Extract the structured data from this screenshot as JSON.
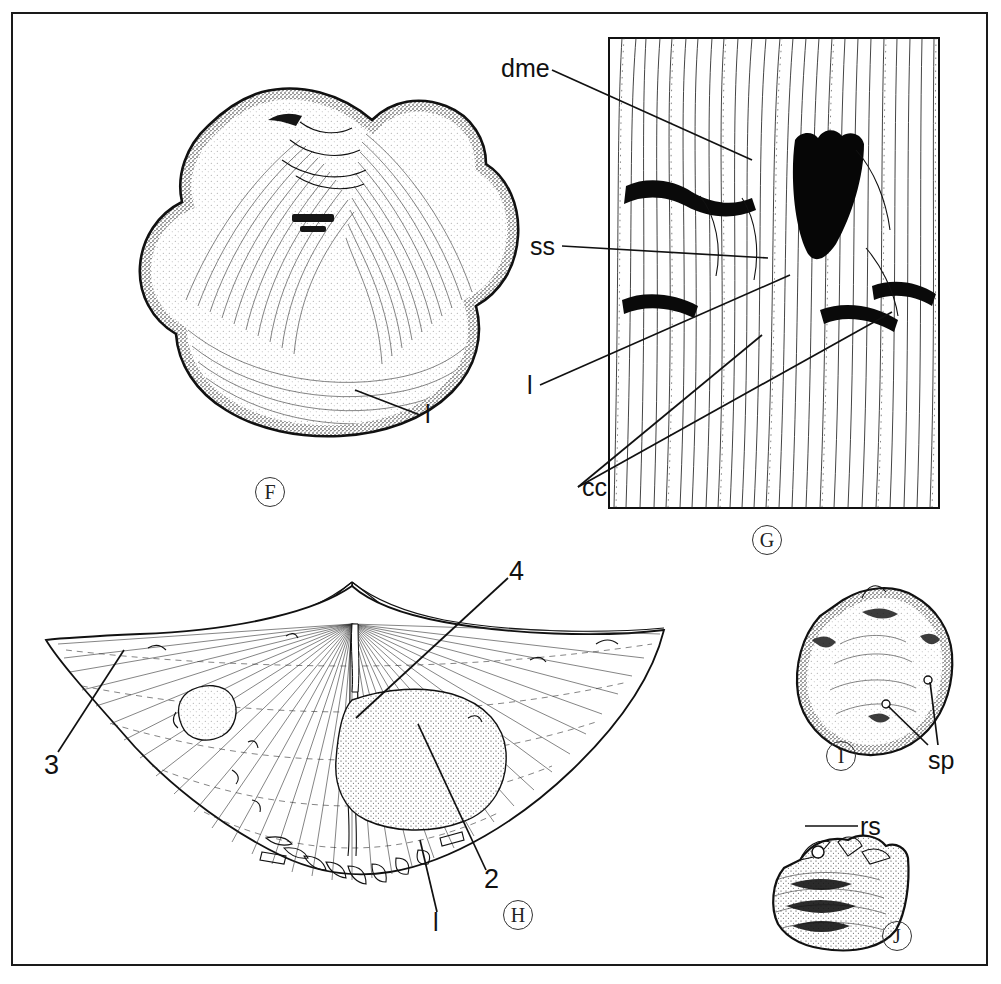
{
  "figure": {
    "type": "scientific-plate",
    "background_color": "#ffffff",
    "ink_color": "#111111",
    "border_color": "#1a1a1a"
  },
  "panels": [
    {
      "id": "F",
      "tag": "F",
      "kind": "specimen-stipple-drawing",
      "description": "Sub-circular brachiopod valve in plan view with radial costellae and concentric growth lamellae",
      "annotations": [
        {
          "text": "l",
          "name": "lamella-label"
        }
      ]
    },
    {
      "id": "G",
      "tag": "G",
      "kind": "framed-line-drawing",
      "description": "Enlarged detail of shell exterior showing costellae, a dark triangular depression and cicatrices",
      "has_frame": true,
      "annotations": [
        {
          "text": "dme",
          "name": "dme-label"
        },
        {
          "text": "ss",
          "name": "ss-label"
        },
        {
          "text": "l",
          "name": "l-label"
        },
        {
          "text": "cc",
          "name": "cc-label"
        }
      ]
    },
    {
      "id": "H",
      "tag": "H",
      "kind": "line-drawing",
      "description": "Wide alate (winged) brachiopod valve, interior view with hinge line, radial ribs, stippled muscle field and spines",
      "annotations": [
        {
          "text": "4",
          "name": "feature-4-label"
        },
        {
          "text": "3",
          "name": "feature-3-label"
        },
        {
          "text": "2",
          "name": "feature-2-label"
        },
        {
          "text": "l",
          "name": "lamella-label"
        }
      ]
    },
    {
      "id": "I",
      "tag": "I",
      "kind": "specimen-stipple-drawing",
      "description": "Sub-triangular valve with roughened margins and spine bases",
      "annotations": [
        {
          "text": "sp",
          "name": "spine-label"
        }
      ]
    },
    {
      "id": "J",
      "tag": "J",
      "kind": "specimen-stipple-drawing",
      "description": "Lateral profile of valve with projecting rostrum and textured surface",
      "annotations": [
        {
          "text": "rs",
          "name": "rostrum-label"
        }
      ]
    }
  ],
  "legend_keys": {
    "dme": "dme",
    "ss": "ss",
    "l": "l",
    "cc": "cc",
    "sp": "sp",
    "rs": "rs",
    "two": "2",
    "three": "3",
    "four": "4"
  }
}
